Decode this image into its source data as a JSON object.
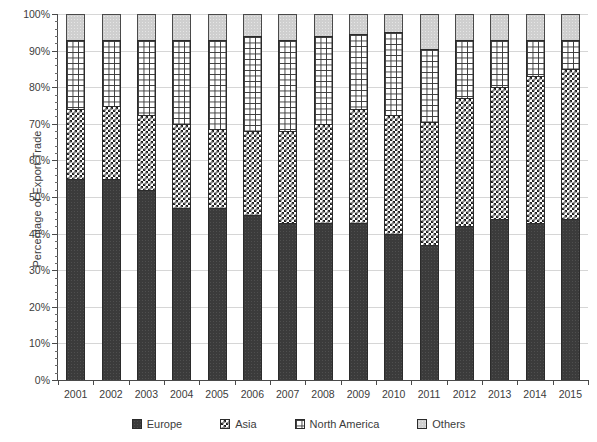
{
  "chart_data": {
    "type": "bar",
    "subtype": "stacked-percentage",
    "title": "",
    "xlabel": "",
    "ylabel": "Percentage of Export Trade",
    "ylim": [
      0,
      100
    ],
    "ytick_labels": [
      "0%",
      "10%",
      "20%",
      "30%",
      "40%",
      "50%",
      "60%",
      "70%",
      "80%",
      "90%",
      "100%"
    ],
    "ytick_values": [
      0,
      10,
      20,
      30,
      40,
      50,
      60,
      70,
      80,
      90,
      100
    ],
    "yminor_step": 2,
    "grid": true,
    "grid_axis": "y",
    "legend_position": "bottom",
    "categories": [
      "2001",
      "2002",
      "2003",
      "2004",
      "2005",
      "2006",
      "2007",
      "2008",
      "2009",
      "2010",
      "2011",
      "2012",
      "2013",
      "2014",
      "2015"
    ],
    "series": [
      {
        "name": "Europe",
        "pattern": "solid-dark",
        "color": "#3b3b3b",
        "values": [
          55,
          55,
          52,
          47,
          47,
          45,
          43,
          43,
          43,
          40,
          37,
          42,
          44,
          43,
          44
        ]
      },
      {
        "name": "Asia",
        "pattern": "checkerboard",
        "color": "#1f1f1f",
        "values": [
          19,
          20,
          20.5,
          23,
          21.5,
          23,
          25,
          27,
          31,
          32.5,
          33.5,
          35,
          36,
          40,
          41
        ]
      },
      {
        "name": "North America",
        "pattern": "grid",
        "color": "#3a3a3a",
        "values": [
          19,
          18,
          20.5,
          23,
          24.5,
          26,
          25,
          24,
          20.5,
          22.5,
          20,
          16,
          13,
          10,
          8
        ]
      },
      {
        "name": "Others",
        "pattern": "light-gray",
        "color": "#cfcfcf",
        "values": [
          7,
          7,
          7,
          7,
          7,
          6,
          7,
          6,
          5.5,
          5,
          9.5,
          7,
          7,
          7,
          7
        ]
      }
    ],
    "stack_tops": {
      "europe": [
        55,
        55,
        52,
        47,
        47,
        45,
        43,
        43,
        43,
        40,
        37,
        42,
        44,
        43,
        44
      ],
      "asia": [
        74,
        75,
        72.5,
        70,
        68.5,
        68,
        68,
        70,
        74,
        72.5,
        70.5,
        77,
        80,
        83,
        85
      ],
      "north_america": [
        93,
        93,
        93,
        93,
        93,
        94,
        93,
        94,
        94.5,
        95,
        90.5,
        93,
        93,
        93,
        93
      ],
      "others": [
        100,
        100,
        100,
        100,
        100,
        100,
        100,
        100,
        100,
        100,
        100,
        100,
        100,
        100,
        100
      ]
    }
  },
  "legend": {
    "items": [
      {
        "label": "Europe"
      },
      {
        "label": "Asia"
      },
      {
        "label": "North America"
      },
      {
        "label": "Others"
      }
    ]
  }
}
